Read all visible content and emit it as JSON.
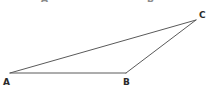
{
  "figure": {
    "kind": "triangle-diagram",
    "width": 210,
    "height": 91,
    "background_color": "#ffffff",
    "stroke_color": "#5a5a5a",
    "stroke_width": 1,
    "label_color": "#2a2a2a",
    "ghost_label_color": "#8c8c8c"
  },
  "vertices": [
    {
      "id": "A",
      "label": "A",
      "x": 10,
      "y": 73
    },
    {
      "id": "B",
      "label": "B",
      "x": 126,
      "y": 73
    },
    {
      "id": "C",
      "label": "C",
      "x": 196,
      "y": 20
    }
  ],
  "edges": [
    {
      "id": "AB",
      "from": "A",
      "to": "B",
      "points": "10,73 126,73"
    },
    {
      "id": "AC",
      "from": "A",
      "to": "C",
      "points": "10,73 196,20"
    },
    {
      "id": "BC",
      "from": "B",
      "to": "C",
      "points": "126,73 196,20"
    }
  ],
  "path": "10,73 126,73 196,20",
  "ghost_labels": [
    {
      "id": "ghost-A",
      "label": "A",
      "x": 45,
      "y": 1
    },
    {
      "id": "ghost-B",
      "label": "B",
      "x": 152,
      "y": 1
    }
  ]
}
